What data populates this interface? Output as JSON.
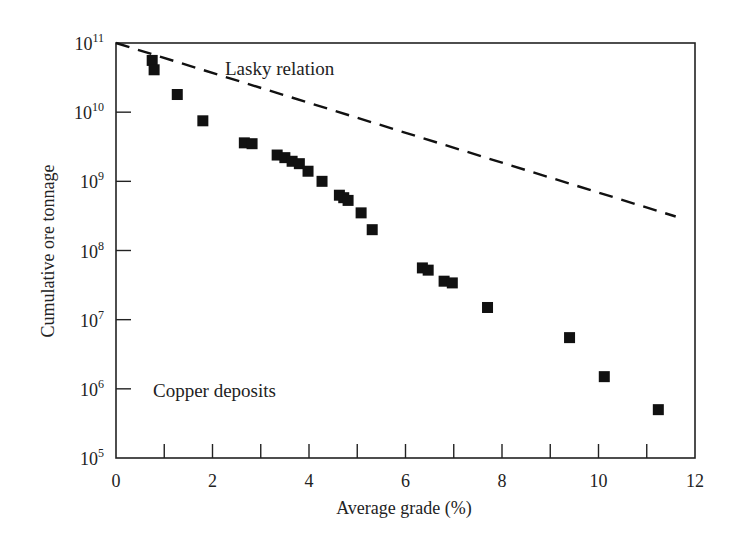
{
  "chart_data": {
    "type": "scatter",
    "title": "",
    "xlabel": "Average grade (%)",
    "ylabel": "Cumulative ore tonnage",
    "xlim": [
      0,
      12
    ],
    "ylim": [
      100000,
      100000000000
    ],
    "yscale": "log",
    "grid": false,
    "legend": null,
    "x_ticks": [
      0,
      2,
      4,
      6,
      8,
      10,
      12
    ],
    "x_minor_ticks": [
      1,
      2,
      3,
      4,
      5,
      6,
      7,
      8,
      9,
      10,
      11
    ],
    "y_ticks": [
      {
        "base": "10",
        "exp": "5",
        "value": 100000
      },
      {
        "base": "10",
        "exp": "6",
        "value": 1000000
      },
      {
        "base": "10",
        "exp": "7",
        "value": 10000000
      },
      {
        "base": "10",
        "exp": "8",
        "value": 100000000
      },
      {
        "base": "10",
        "exp": "9",
        "value": 1000000000
      },
      {
        "base": "10",
        "exp": "10",
        "value": 10000000000
      },
      {
        "base": "10",
        "exp": "11",
        "value": 100000000000
      }
    ],
    "annotations": [
      {
        "text": "Lasky relation",
        "x": 2.3,
        "y": 50000000000
      },
      {
        "text": "Copper deposits",
        "x": 0.8,
        "y": 1000000
      }
    ],
    "series": [
      {
        "name": "Copper deposits",
        "marker": "square",
        "points": [
          {
            "x": 0.75,
            "y": 56000000000
          },
          {
            "x": 0.79,
            "y": 41000000000
          },
          {
            "x": 1.27,
            "y": 18000000000
          },
          {
            "x": 1.8,
            "y": 7500000000
          },
          {
            "x": 2.66,
            "y": 3600000000
          },
          {
            "x": 2.82,
            "y": 3500000000
          },
          {
            "x": 3.34,
            "y": 2400000000
          },
          {
            "x": 3.5,
            "y": 2200000000
          },
          {
            "x": 3.65,
            "y": 1950000000
          },
          {
            "x": 3.8,
            "y": 1800000000
          },
          {
            "x": 3.98,
            "y": 1400000000
          },
          {
            "x": 4.27,
            "y": 1000000000
          },
          {
            "x": 4.63,
            "y": 630000000
          },
          {
            "x": 4.72,
            "y": 580000000
          },
          {
            "x": 4.81,
            "y": 530000000
          },
          {
            "x": 5.08,
            "y": 350000000
          },
          {
            "x": 5.31,
            "y": 200000000
          },
          {
            "x": 6.35,
            "y": 56000000
          },
          {
            "x": 6.47,
            "y": 52000000
          },
          {
            "x": 6.8,
            "y": 36000000
          },
          {
            "x": 6.97,
            "y": 34000000
          },
          {
            "x": 7.7,
            "y": 15000000
          },
          {
            "x": 9.4,
            "y": 5500000
          },
          {
            "x": 10.12,
            "y": 1500000
          },
          {
            "x": 11.24,
            "y": 500000
          }
        ]
      },
      {
        "name": "Lasky relation (fit)",
        "style": "dashed",
        "points": [
          {
            "x": 0.0,
            "y": 100000000000
          },
          {
            "x": 11.6,
            "y": 310000000
          }
        ]
      }
    ]
  },
  "labels": {
    "xlabel": "Average grade (%)",
    "ylabel": "Cumulative ore tonnage",
    "annotation_lasky": "Lasky relation",
    "annotation_copper": "Copper deposits"
  }
}
